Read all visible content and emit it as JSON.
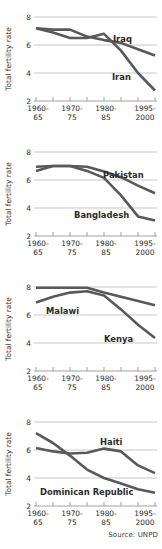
{
  "figure": {
    "source_note": "Source: UNPD",
    "y_axis_title": "Total fertility rate",
    "y_ticks": [
      "8",
      "6",
      "4",
      "2"
    ],
    "y_tick_values": [
      8,
      6,
      4,
      2
    ],
    "x_tick_labels": [
      {
        "line1": "1960-",
        "line2": "65"
      },
      {
        "line1": "1970-",
        "line2": "75"
      },
      {
        "line1": "1980-",
        "line2": "85"
      },
      {
        "line1": "1995-",
        "line2": "2000"
      }
    ],
    "line_color": "#595959",
    "grid_color": "#b9b9b9",
    "text_color": "#2b2b2b"
  },
  "chart_data": [
    {
      "type": "line",
      "title": "",
      "xlabel": "",
      "ylabel": "Total fertility rate",
      "ylim": [
        2,
        8
      ],
      "grid": true,
      "legend": "inline-labels",
      "categories": [
        "1960-65",
        "1965-70",
        "1970-75",
        "1975-80",
        "1980-85",
        "1985-90",
        "1990-95",
        "1995-2000"
      ],
      "series": [
        {
          "name": "Iraq",
          "values": [
            7.2,
            7.1,
            7.1,
            6.6,
            6.35,
            6.15,
            5.7,
            5.25
          ]
        },
        {
          "name": "Iran",
          "values": [
            7.2,
            6.9,
            6.5,
            6.5,
            6.8,
            5.6,
            4.0,
            2.75
          ]
        }
      ]
    },
    {
      "type": "line",
      "title": "",
      "xlabel": "",
      "ylabel": "Total fertility rate",
      "ylim": [
        2,
        8
      ],
      "grid": true,
      "legend": "inline-labels",
      "categories": [
        "1960-65",
        "1965-70",
        "1970-75",
        "1975-80",
        "1980-85",
        "1985-90",
        "1990-95",
        "1995-2000"
      ],
      "series": [
        {
          "name": "Pakistan",
          "values": [
            6.95,
            7.0,
            7.0,
            6.95,
            6.6,
            6.2,
            5.6,
            5.05
          ]
        },
        {
          "name": "Bangladesh",
          "values": [
            6.65,
            7.0,
            7.0,
            6.65,
            6.15,
            4.9,
            3.4,
            3.1
          ]
        }
      ]
    },
    {
      "type": "line",
      "title": "",
      "xlabel": "",
      "ylabel": "Total fertility rate",
      "ylim": [
        2,
        8
      ],
      "grid": true,
      "legend": "inline-labels",
      "categories": [
        "1960-65",
        "1965-70",
        "1970-75",
        "1975-80",
        "1980-85",
        "1985-90",
        "1990-95",
        "1995-2000"
      ],
      "series": [
        {
          "name": "Malawi",
          "values": [
            7.95,
            7.95,
            7.95,
            7.95,
            7.6,
            7.3,
            7.0,
            6.7
          ]
        },
        {
          "name": "Kenya",
          "values": [
            6.9,
            7.3,
            7.6,
            7.7,
            7.4,
            6.4,
            5.3,
            4.35
          ]
        }
      ]
    },
    {
      "type": "line",
      "title": "",
      "xlabel": "",
      "ylabel": "Total fertility rate",
      "ylim": [
        2,
        8
      ],
      "grid": true,
      "legend": "inline-labels",
      "categories": [
        "1960-65",
        "1965-70",
        "1970-75",
        "1975-80",
        "1980-85",
        "1985-90",
        "1990-95",
        "1995-2000"
      ],
      "series": [
        {
          "name": "Haiti",
          "values": [
            6.15,
            5.9,
            5.75,
            5.8,
            6.1,
            5.9,
            4.9,
            4.35
          ]
        },
        {
          "name": "Dominican Republic",
          "values": [
            7.2,
            6.5,
            5.6,
            4.6,
            4.0,
            3.6,
            3.2,
            2.95
          ]
        }
      ]
    }
  ]
}
